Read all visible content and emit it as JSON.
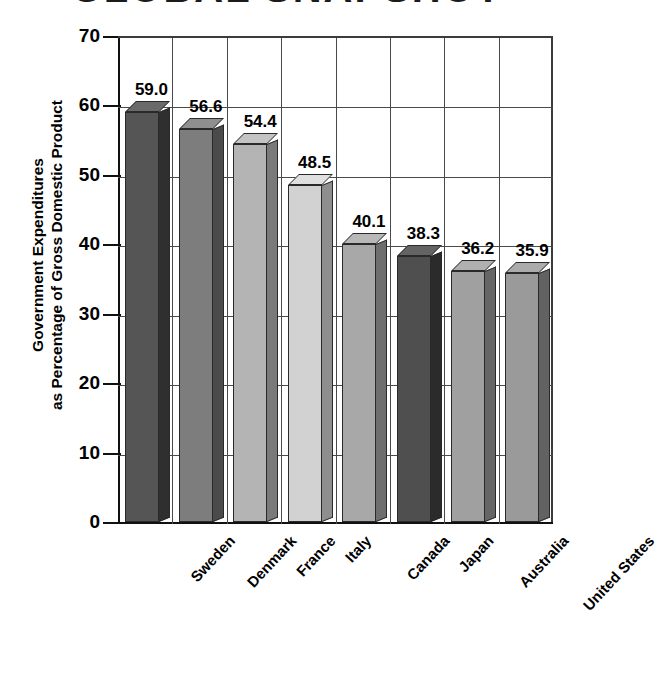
{
  "chart_data": {
    "type": "bar",
    "title": "GLOBAL SNAPSHOT",
    "xlabel": "",
    "ylabel": "Government Expenditures as Percentage of Gross Domestic Product",
    "ylabel_line1": "Government Expenditures",
    "ylabel_line2": "as Percentage of Gross Domestic Product",
    "categories": [
      "Sweden",
      "Denmark",
      "France",
      "Italy",
      "Canada",
      "Japan",
      "Australia",
      "United States"
    ],
    "values": [
      59.0,
      56.6,
      54.4,
      48.5,
      40.1,
      38.3,
      36.2,
      35.9
    ],
    "value_labels": [
      "59.0",
      "56.6",
      "54.4",
      "48.5",
      "40.1",
      "38.3",
      "36.2",
      "35.9"
    ],
    "ylim": [
      0,
      70
    ],
    "yticks": [
      0,
      10,
      20,
      30,
      40,
      50,
      60,
      70
    ],
    "ytick_labels": [
      "0",
      "10",
      "20",
      "30",
      "40",
      "50",
      "60",
      "70"
    ],
    "grid": "horizontal and vertical gridlines on",
    "legend": "none",
    "style": "3d grayscale columns",
    "bar_colors": [
      "#555555",
      "#7d7d7d",
      "#b4b4b4",
      "#d2d2d2",
      "#a8a8a8",
      "#4f4f4f",
      "#a0a0a0",
      "#9a9a9a"
    ],
    "bar_side_colors": [
      "#2f2f2f",
      "#4b4b4b",
      "#7a7a7a",
      "#8e8e8e",
      "#6e6e6e",
      "#2b2b2b",
      "#666666",
      "#626262"
    ],
    "bar_top_colors": [
      "#6a6a6a",
      "#8f8f8f",
      "#c4c4c4",
      "#e0e0e0",
      "#b8b8b8",
      "#646464",
      "#b0b0b0",
      "#ababab"
    ]
  }
}
